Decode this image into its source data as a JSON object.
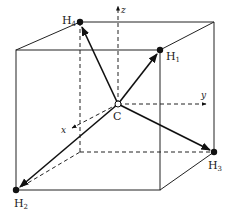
{
  "diagram": {
    "title": "",
    "atoms": [
      {
        "id": "H4",
        "element": "H",
        "subscript": "4",
        "x": 80,
        "y": 22,
        "label_x": 62,
        "label_y": 20
      },
      {
        "id": "H1",
        "element": "H",
        "subscript": "1",
        "x": 160,
        "y": 50,
        "label_x": 166,
        "label_y": 60
      },
      {
        "id": "H3",
        "element": "H",
        "subscript": "3",
        "x": 214,
        "y": 152,
        "label_x": 208,
        "label_y": 170
      },
      {
        "id": "H2",
        "element": "H",
        "subscript": "2",
        "x": 16,
        "y": 190,
        "label_x": 16,
        "label_y": 208
      },
      {
        "id": "C",
        "element": "C",
        "subscript": "",
        "x": 118,
        "y": 104,
        "label_x": 113,
        "label_y": 120
      }
    ],
    "axes": [
      {
        "name": "z",
        "label": "z"
      },
      {
        "name": "y",
        "label": "y"
      },
      {
        "name": "x",
        "label": "x"
      }
    ],
    "colors": {
      "ink": "#111111",
      "background": "#ffffff"
    }
  }
}
